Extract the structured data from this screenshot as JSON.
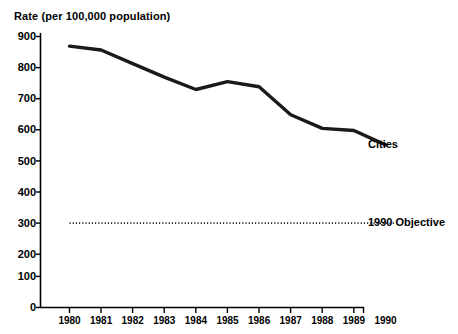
{
  "chart_data": {
    "type": "line",
    "title": "",
    "ylabel": "Rate (per 100,000 population)",
    "xlabel": "",
    "grid": false,
    "legend_position": "right-inline",
    "ylim": [
      0,
      900
    ],
    "ytick_values": [
      0,
      100,
      200,
      300,
      400,
      500,
      600,
      700,
      800,
      900
    ],
    "ytick_labels": [
      "0",
      "100",
      "200",
      "300",
      "400",
      "500",
      "600",
      "700",
      "800",
      "900"
    ],
    "categories": [
      "1980",
      "1981",
      "1982",
      "1983",
      "1984",
      "1985",
      "1986",
      "1987",
      "1988",
      "1989",
      "1990"
    ],
    "x": [
      1980,
      1981,
      1982,
      1983,
      1984,
      1985,
      1986,
      1987,
      1988,
      1989,
      1990
    ],
    "series": [
      {
        "name": "Cities",
        "style": "solid",
        "color": "#1a1a1a",
        "label_text": "Cities",
        "values": [
          868,
          855,
          810,
          765,
          724,
          750,
          733,
          640,
          595,
          588,
          540
        ]
      },
      {
        "name": "1990 Objective",
        "style": "dotted",
        "color": "#1a1a1a",
        "label_text": "1990 Objective",
        "values": [
          280,
          280,
          280,
          280,
          280,
          280,
          280,
          280,
          280,
          280,
          280
        ]
      }
    ],
    "annotations": [
      {
        "text": "Cities",
        "x": 1990,
        "y": 540
      },
      {
        "text": "1990 Objective",
        "x": 1990,
        "y": 280
      }
    ]
  },
  "colors": {
    "background": "#ffffff",
    "ink": "#000000",
    "line": "#1a1a1a"
  }
}
